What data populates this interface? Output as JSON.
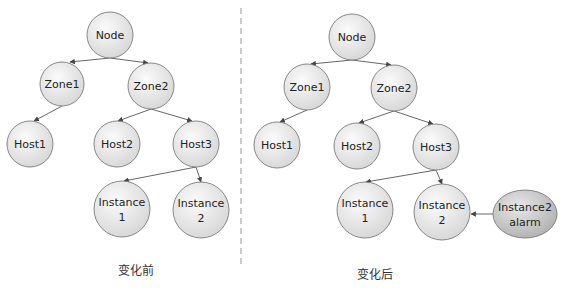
{
  "colors": {
    "node_fill_light": "#f7f7f7",
    "node_fill_dark": "#d9d9d9",
    "alarm_fill_light": "#e4e4e4",
    "alarm_fill_dark": "#b8b8b8",
    "stroke": "#7a7a7a",
    "edge": "#555555",
    "divider": "#999999"
  },
  "left": {
    "caption": "变化前",
    "nodes": [
      {
        "id": "node",
        "label": "Node",
        "cx": 110,
        "cy": 35,
        "r": 23
      },
      {
        "id": "zone1",
        "label": "Zone1",
        "cx": 62,
        "cy": 84,
        "r": 22
      },
      {
        "id": "zone2",
        "label": "Zone2",
        "cx": 151,
        "cy": 86,
        "r": 23
      },
      {
        "id": "host1",
        "label": "Host1",
        "cx": 30,
        "cy": 144,
        "r": 23
      },
      {
        "id": "host2",
        "label": "Host2",
        "cx": 117,
        "cy": 144,
        "r": 23
      },
      {
        "id": "host3",
        "label": "Host3",
        "cx": 196,
        "cy": 144,
        "r": 23
      },
      {
        "id": "instance1",
        "label": "Instance",
        "label2": "1",
        "cx": 122,
        "cy": 209,
        "r": 28
      },
      {
        "id": "instance2",
        "label": "Instance",
        "label2": "2",
        "cx": 201,
        "cy": 210,
        "r": 28
      }
    ]
  },
  "right": {
    "caption": "变化后",
    "nodes": [
      {
        "id": "node",
        "label": "Node",
        "cx": 352,
        "cy": 37,
        "r": 23
      },
      {
        "id": "zone1",
        "label": "Zone1",
        "cx": 307,
        "cy": 87,
        "r": 23
      },
      {
        "id": "zone2",
        "label": "Zone2",
        "cx": 394,
        "cy": 88,
        "r": 23
      },
      {
        "id": "host1",
        "label": "Host1",
        "cx": 277,
        "cy": 145,
        "r": 23
      },
      {
        "id": "host2",
        "label": "Host2",
        "cx": 357,
        "cy": 146,
        "r": 23
      },
      {
        "id": "host3",
        "label": "Host3",
        "cx": 436,
        "cy": 147,
        "r": 23
      },
      {
        "id": "instance1",
        "label": "Instance",
        "label2": "1",
        "cx": 365,
        "cy": 210,
        "r": 28
      },
      {
        "id": "instance2",
        "label": "Instance",
        "label2": "2",
        "cx": 442,
        "cy": 212,
        "r": 28
      }
    ],
    "alarm": {
      "label": "Instance2",
      "label2": "alarm",
      "cx": 525,
      "cy": 214,
      "rx": 32,
      "ry": 24
    }
  }
}
